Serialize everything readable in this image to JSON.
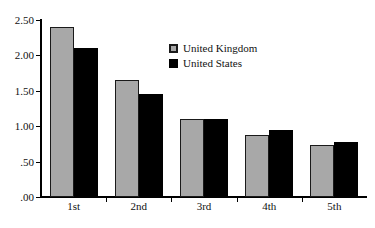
{
  "chart_data": {
    "type": "bar",
    "title": "",
    "xlabel": "",
    "ylabel": "",
    "categories": [
      "1st",
      "2nd",
      "3rd",
      "4th",
      "5th"
    ],
    "series": [
      {
        "name": "United Kingdom",
        "color": "#a8a8a8",
        "values": [
          2.4,
          1.65,
          1.1,
          0.87,
          0.74
        ]
      },
      {
        "name": "United States",
        "color": "#000000",
        "values": [
          2.1,
          1.45,
          1.1,
          0.95,
          0.77
        ]
      }
    ],
    "ylim": [
      0,
      2.5
    ],
    "yticks": [
      0,
      0.5,
      1.0,
      1.5,
      2.0,
      2.5
    ],
    "ytick_labels": [
      ".00",
      ".50",
      "1.00",
      "1.50",
      "2.00",
      "2.50"
    ],
    "grid": false,
    "legend_position": "top-right"
  },
  "legend": {
    "entries": [
      {
        "label": "United Kingdom"
      },
      {
        "label": "United States"
      }
    ]
  },
  "axes": {
    "y_labels": [
      "2.50",
      "2.00",
      "1.50",
      "1.00",
      ".50",
      ".00"
    ],
    "x_labels": [
      "1st",
      "2nd",
      "3rd",
      "4th",
      "5th"
    ]
  }
}
